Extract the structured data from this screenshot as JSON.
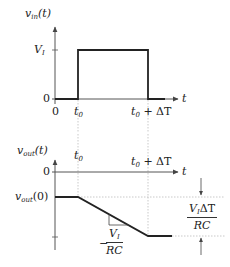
{
  "diagram": {
    "top_graph": {
      "y_label": {
        "base": "v",
        "sub": "in",
        "suffix": "(t)"
      },
      "x_label": "t",
      "y_ticks": [
        {
          "label": "V",
          "sub": "I",
          "value": "V_I"
        },
        {
          "label": "0",
          "value": "0"
        }
      ],
      "x_ticks": [
        {
          "label": "0"
        },
        {
          "label": "t",
          "sub": "0"
        },
        {
          "label": "t",
          "sub": "0",
          "suffix": " + ΔT"
        }
      ],
      "signal": "Rectangular pulse of height V_I from t0 to t0 + ΔT"
    },
    "bottom_graph": {
      "y_label": {
        "base": "v",
        "sub": "out",
        "suffix": "(t)"
      },
      "x_label": "t",
      "y_ticks": [
        {
          "label": "0"
        },
        {
          "label": "v",
          "sub": "out",
          "suffix": "(0)"
        }
      ],
      "x_ticks": [
        {
          "label": "t",
          "sub": "0"
        },
        {
          "label": "t",
          "sub": "0",
          "suffix": " + ΔT"
        }
      ],
      "slope_label": {
        "sign": "−",
        "numerator": "V",
        "numerator_sub": "I",
        "denominator": "RC"
      },
      "drop_label": {
        "numerator": "V",
        "numerator_sub": "I",
        "numerator_suffix": "ΔT",
        "denominator": "RC"
      },
      "signal": "Constant at v_out(0), ramps down with slope −V_I/RC between t0 and t0 + ΔT, then constant"
    },
    "colors": {
      "line": "#222222",
      "axis": "#555555",
      "guide": "#bbbbbb"
    }
  }
}
